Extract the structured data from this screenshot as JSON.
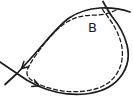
{
  "figure": {
    "type": "hand-drawn-curve-sketch",
    "label": {
      "text": "B"
    },
    "colors": {
      "stroke": "#1b1b1b",
      "background": "#ffffff"
    },
    "curves": {
      "outer_solid": "M 130 12 C 120 8.5 110 7.5 100 8 C 88 8.8 78 12 69 18 C 56 27 44 45 17 73.5 L 5 84.5",
      "return_solid": "M 0 62 L 17 73.5 C 23 78 30 82.5 38 86 C 53 92.5 72 96 89 93.5 C 104 91.3 116 84 122.5 74 C 128 65.5 129.5 55 127 45 C 124.5 35 119 25 112 16.5 C 109 12.5 106 7 103 1.5",
      "dashed_orbit": "M 116 10 C 109 13.8 101 15.2 93 15.2 C 82 15.2 72 18 64 24 C 54 31.5 45 42 36 55 C 31 62 27.5 67.5 27 71.5 C 26.6 74.5 28 77.5 31 79.8 C 38 85 50 89 62 90.8 C 76 92.8 92 91.5 103 86 C 112 81.5 118 74 120.8 65 C 123.5 56 122.8 46 119 36.5 C 115.5 27.5 110 19 104.5 12.5 L 102 8.5"
    },
    "arrows": {
      "flank_arrowhead": "23.9,61.5 21.5,68.5 28.7,66.8",
      "bottom_arrowhead": "31.6,86.5 39,85.8 34.4,79.9"
    }
  }
}
